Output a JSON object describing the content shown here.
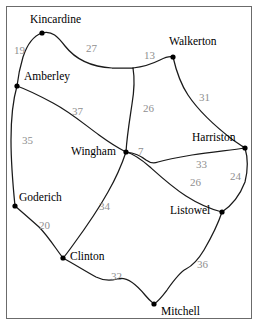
{
  "figure": {
    "frame_color": "#6b6b6b",
    "background_color": "#ffffff"
  },
  "chart_data": {
    "type": "diagram",
    "subtype": "weighted-graph-map",
    "title": "",
    "node_color": "#000000",
    "edge_color": "#1a1a1a",
    "edge_label_color": "#8f8f8f",
    "node_label_color": "#000000",
    "nodes": [
      {
        "id": "kincardine",
        "label": "Kincardine",
        "x": 42,
        "y": 33,
        "label_x": 30,
        "label_y": 14
      },
      {
        "id": "walkerton",
        "label": "Walkerton",
        "x": 173,
        "y": 57,
        "label_x": 169,
        "label_y": 36
      },
      {
        "id": "amberley",
        "label": "Amberley",
        "x": 17,
        "y": 86,
        "label_x": 24,
        "label_y": 71
      },
      {
        "id": "harriston",
        "label": "Harriston",
        "x": 245,
        "y": 148,
        "label_x": 192,
        "label_y": 132
      },
      {
        "id": "wingham",
        "label": "Wingham",
        "x": 126,
        "y": 152,
        "label_x": 71,
        "label_y": 146
      },
      {
        "id": "goderich",
        "label": "Goderich",
        "x": 15,
        "y": 206,
        "label_x": 19,
        "label_y": 192
      },
      {
        "id": "listowel",
        "label": "Listowel",
        "x": 222,
        "y": 212,
        "label_x": 170,
        "label_y": 205
      },
      {
        "id": "clinton",
        "label": "Clinton",
        "x": 63,
        "y": 258,
        "label_x": 70,
        "label_y": 251
      },
      {
        "id": "mitchell",
        "label": "Mitchell",
        "x": 154,
        "y": 304,
        "label_x": 161,
        "label_y": 306
      }
    ],
    "edges": [
      {
        "from": "kincardine",
        "to": "amberley",
        "weight": 19,
        "label_x": 14,
        "label_y": 45
      },
      {
        "from": "kincardine",
        "to": "walkerton",
        "weight": 27,
        "label_x": 86,
        "label_y": 43
      },
      {
        "from": "walkerton",
        "to": "wingham",
        "weight": 13,
        "label_x": 144,
        "label_y": 50
      },
      {
        "from": "walkerton",
        "to": "harriston",
        "weight": 31,
        "label_x": 199,
        "label_y": 92
      },
      {
        "from": "wingham",
        "to": "walkerton_mid",
        "weight": 26,
        "label_x": 143,
        "label_y": 103
      },
      {
        "from": "amberley",
        "to": "wingham",
        "weight": 37,
        "label_x": 72,
        "label_y": 106
      },
      {
        "from": "amberley",
        "to": "goderich",
        "weight": 35,
        "label_x": 22,
        "label_y": 135
      },
      {
        "from": "wingham",
        "to": "harriston",
        "weight": 7,
        "label_x": 138,
        "label_y": 146
      },
      {
        "from": "harriston",
        "to": "listowel_upper",
        "weight": 33,
        "label_x": 196,
        "label_y": 159
      },
      {
        "from": "wingham",
        "to": "listowel",
        "weight": 26,
        "label_x": 190,
        "label_y": 177
      },
      {
        "from": "harriston",
        "to": "listowel",
        "weight": 24,
        "label_x": 230,
        "label_y": 171
      },
      {
        "from": "wingham",
        "to": "clinton",
        "weight": 34,
        "label_x": 99,
        "label_y": 201
      },
      {
        "from": "goderich",
        "to": "clinton",
        "weight": 20,
        "label_x": 39,
        "label_y": 220
      },
      {
        "from": "clinton",
        "to": "mitchell",
        "weight": 32,
        "label_x": 111,
        "label_y": 271
      },
      {
        "from": "listowel",
        "to": "mitchell",
        "weight": 36,
        "label_x": 197,
        "label_y": 259
      }
    ],
    "edge_paths": [
      {
        "id": "path-kincardine-amberley",
        "d": "M 42 33 C 33 36 27 45 23 57 C 20 67 18 77 17 86"
      },
      {
        "id": "path-kincardine-walkerton-wingham-junction",
        "d": "M 42 33 C 52 30 58 37 65 46 C 76 60 93 67 112 68 C 121 68 128 68 133 68"
      },
      {
        "id": "path-junction-walkerton",
        "d": "M 133 68 C 142 67 152 64 160 60 C 166 57 170 56 173 57"
      },
      {
        "id": "path-junction-wingham",
        "d": "M 133 68 C 135 80 134 92 132 104 C 130 118 127 135 126 152"
      },
      {
        "id": "path-walkerton-harriston",
        "d": "M 173 57 C 176 70 180 83 188 95 C 200 113 220 130 233 140 C 239 144 243 147 245 148"
      },
      {
        "id": "path-amberley-wingham",
        "d": "M 17 86 C 28 90 40 96 53 103 C 70 112 84 124 99 135 C 110 143 120 149 126 152"
      },
      {
        "id": "path-amberley-goderich",
        "d": "M 17 86 C 13 100 11 120 11 140 C 11 162 13 186 15 206"
      },
      {
        "id": "path-wingham-harriston",
        "d": "M 126 152 C 134 153 140 155 146 160 C 150 163 153 164 158 162 C 168 159 180 157 192 155 C 212 152 232 150 245 148"
      },
      {
        "id": "path-wingham-listowel",
        "d": "M 126 152 C 134 154 142 160 150 167 C 160 176 172 187 186 196 C 200 205 214 210 222 212"
      },
      {
        "id": "path-harriston-listowel",
        "d": "M 245 148 C 248 158 248 170 245 182 C 240 195 231 206 222 212"
      },
      {
        "id": "path-wingham-clinton",
        "d": "M 126 152 C 122 164 116 178 108 192 C 98 210 84 230 73 245 C 68 252 65 256 63 258"
      },
      {
        "id": "path-goderich-clinton",
        "d": "M 15 206 C 22 212 30 219 39 227 C 48 236 56 249 63 258"
      },
      {
        "id": "path-clinton-mitchell",
        "d": "M 63 258 C 74 264 85 271 96 277 C 104 281 110 281 117 279 C 126 276 136 284 145 295 C 150 301 153 303 154 304"
      },
      {
        "id": "path-listowel-mitchell",
        "d": "M 222 212 C 218 224 211 238 204 250 C 198 260 192 266 186 269 C 180 272 174 280 167 290 C 161 298 157 302 154 304"
      }
    ],
    "junctions": [
      {
        "id": "junction-north",
        "x": 133,
        "y": 68
      },
      {
        "id": "junction-harriston-branch",
        "x": 156,
        "y": 163
      }
    ]
  }
}
